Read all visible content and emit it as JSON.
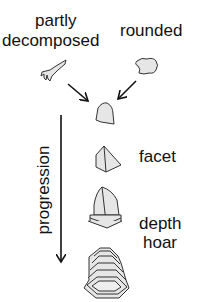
{
  "diagram": {
    "labels": {
      "partly_decomposed_line1": "partly",
      "partly_decomposed_line2": "decomposed",
      "rounded": "rounded",
      "facet": "facet",
      "depth_hoar_line1": "depth",
      "depth_hoar_line2": "hoar",
      "progression": "progression"
    },
    "shapes": [
      {
        "name": "partly-decomposed-crystal"
      },
      {
        "name": "rounded-grain"
      },
      {
        "name": "transitional-grain"
      },
      {
        "name": "faceted-crystal"
      },
      {
        "name": "depth-hoar-crystal"
      },
      {
        "name": "depth-hoar-cup-crystal"
      }
    ],
    "colors": {
      "fill": "#e6e6e6",
      "stroke": "#222222"
    }
  }
}
